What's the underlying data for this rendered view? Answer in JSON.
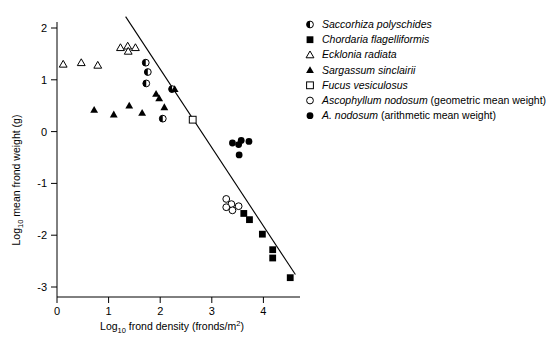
{
  "chart_data": {
    "type": "scatter",
    "title": "",
    "xlabel": "Log10 frond density (fronds/m2)",
    "xlabel_parts": {
      "prefix": "Log",
      "sub": "10",
      "mid": " frond density (fronds/m",
      "sup": "2",
      "suffix": ")"
    },
    "ylabel": "Log10 mean frond weight (g)",
    "ylabel_parts": {
      "prefix": "Log",
      "sub": "10",
      "suffix": " mean frond weight (g)"
    },
    "xlim": [
      -0.1,
      4.75
    ],
    "ylim": [
      -3.25,
      2.3
    ],
    "xticks": [
      "0",
      "1",
      "2",
      "3",
      "4"
    ],
    "xtick_values": [
      0,
      1,
      2,
      3,
      4
    ],
    "yticks": [
      "2",
      "1",
      "0",
      "-1",
      "-2",
      "-3"
    ],
    "ytick_values": [
      2,
      1,
      0,
      -1,
      -2,
      -3
    ],
    "grid": false,
    "legend_position": "right",
    "axis_color": "#000000",
    "marker_color": "#000000",
    "fit_line": {
      "label": "self-thinning regression line",
      "x": [
        1.33,
        4.62
      ],
      "y": [
        2.22,
        -2.76
      ]
    },
    "series": [
      {
        "name": "Saccorhiza polyschides",
        "marker": "half-filled-circle",
        "italic": true,
        "note": "",
        "points": [
          {
            "x": 1.72,
            "y": 1.33
          },
          {
            "x": 1.76,
            "y": 1.15
          },
          {
            "x": 1.73,
            "y": 0.93
          },
          {
            "x": 2.23,
            "y": 0.82
          },
          {
            "x": 2.05,
            "y": 0.25
          }
        ]
      },
      {
        "name": "Chordaria flagelliformis",
        "marker": "filled-square",
        "italic": true,
        "note": "",
        "points": [
          {
            "x": 3.62,
            "y": -1.58
          },
          {
            "x": 3.73,
            "y": -1.7
          },
          {
            "x": 3.98,
            "y": -1.98
          },
          {
            "x": 4.18,
            "y": -2.28
          },
          {
            "x": 4.18,
            "y": -2.44
          },
          {
            "x": 4.52,
            "y": -2.82
          }
        ]
      },
      {
        "name": "Ecklonia radiata",
        "marker": "open-triangle",
        "italic": true,
        "note": "",
        "points": [
          {
            "x": 0.12,
            "y": 1.3
          },
          {
            "x": 0.47,
            "y": 1.33
          },
          {
            "x": 0.79,
            "y": 1.28
          },
          {
            "x": 1.23,
            "y": 1.62
          },
          {
            "x": 1.37,
            "y": 1.65
          },
          {
            "x": 1.38,
            "y": 1.55
          },
          {
            "x": 1.52,
            "y": 1.62
          }
        ]
      },
      {
        "name": "Sargassum sinclairii",
        "marker": "filled-triangle",
        "italic": true,
        "note": "",
        "points": [
          {
            "x": 0.72,
            "y": 0.42
          },
          {
            "x": 1.1,
            "y": 0.33
          },
          {
            "x": 1.4,
            "y": 0.5
          },
          {
            "x": 1.65,
            "y": 0.36
          },
          {
            "x": 1.92,
            "y": 0.73
          },
          {
            "x": 1.98,
            "y": 0.64
          },
          {
            "x": 2.08,
            "y": 0.47
          },
          {
            "x": 2.28,
            "y": 0.82
          }
        ]
      },
      {
        "name": "Fucus vesiculosus",
        "marker": "open-square",
        "italic": true,
        "note": "",
        "points": [
          {
            "x": 2.63,
            "y": 0.23
          }
        ]
      },
      {
        "name": "Ascophyllum nodosum",
        "marker": "open-circle",
        "italic": true,
        "note": "(geometric mean weight)",
        "points": [
          {
            "x": 3.28,
            "y": -1.3
          },
          {
            "x": 3.38,
            "y": -1.4
          },
          {
            "x": 3.28,
            "y": -1.46
          },
          {
            "x": 3.4,
            "y": -1.52
          },
          {
            "x": 3.52,
            "y": -1.44
          }
        ]
      },
      {
        "name": "A. nodosum",
        "marker": "filled-circle",
        "italic": true,
        "note": "(arithmetic mean weight)",
        "points": [
          {
            "x": 3.4,
            "y": -0.22
          },
          {
            "x": 3.52,
            "y": -0.25
          },
          {
            "x": 3.57,
            "y": -0.17
          },
          {
            "x": 3.72,
            "y": -0.19
          },
          {
            "x": 3.53,
            "y": -0.45
          }
        ]
      }
    ]
  },
  "legend": {
    "items": [
      {
        "marker": "half-filled-circle",
        "label": "Saccorhiza polyschides",
        "note": ""
      },
      {
        "marker": "filled-square",
        "label": "Chordaria flagelliformis",
        "note": ""
      },
      {
        "marker": "open-triangle",
        "label": "Ecklonia radiata",
        "note": ""
      },
      {
        "marker": "filled-triangle",
        "label": "Sargassum sinclairii",
        "note": ""
      },
      {
        "marker": "open-square",
        "label": "Fucus vesiculosus",
        "note": ""
      },
      {
        "marker": "open-circle",
        "label": "Ascophyllum nodosum",
        "note": " (geometric mean weight)"
      },
      {
        "marker": "filled-circle",
        "label": "A. nodosum",
        "note": " (arithmetic mean weight)"
      }
    ]
  }
}
